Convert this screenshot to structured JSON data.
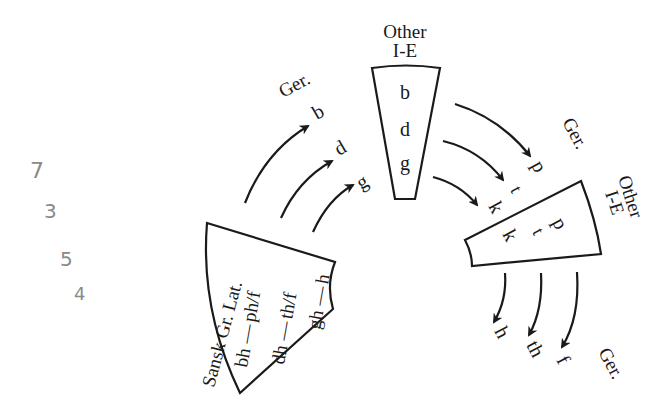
{
  "diagram": {
    "groups": {
      "top_box": {
        "label_line1": "Other",
        "label_line2": "I-E",
        "items": [
          "b",
          "d",
          "g"
        ]
      },
      "top_ger": {
        "label": "Ger.",
        "items": [
          "b",
          "d",
          "g"
        ]
      },
      "left_box": {
        "label": "Sansk Gr. Lat.",
        "rows": [
          {
            "from": "bh",
            "dash": "—",
            "to": "ph/f"
          },
          {
            "from": "dh",
            "dash": "—",
            "to": "th/f"
          },
          {
            "from": "gh",
            "dash": "—",
            "to": "h"
          }
        ]
      },
      "right_ger": {
        "label": "Ger.",
        "items": [
          "p",
          "t",
          "k"
        ]
      },
      "right_box": {
        "label_line1": "Other",
        "label_line2": "I-E",
        "items": [
          "p",
          "t",
          "k"
        ]
      },
      "bottom_ger": {
        "label": "Ger.",
        "items": [
          "h",
          "th",
          "f"
        ]
      }
    },
    "handwritten_notes": [
      "7",
      "3",
      "5",
      "4"
    ]
  }
}
